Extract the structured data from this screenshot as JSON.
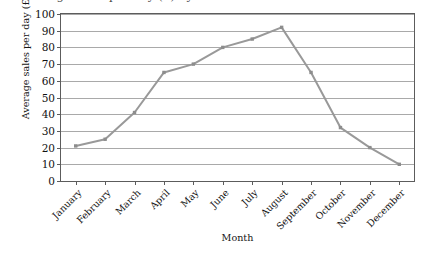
{
  "figure": {
    "title_clipped": "Average sales per day (£) by month",
    "title_is_cut_off": true
  },
  "chart_data": {
    "type": "line",
    "title": "",
    "xlabel": "Month",
    "ylabel": "Average sales per day (£)",
    "categories": [
      "January",
      "February",
      "March",
      "April",
      "May",
      "June",
      "July",
      "August",
      "September",
      "October",
      "November",
      "December"
    ],
    "values": [
      21,
      25,
      41,
      65,
      70,
      80,
      85,
      92,
      65,
      32,
      20,
      10
    ],
    "ylim": [
      0,
      100
    ],
    "ytick_labels": [
      "0",
      "10",
      "20",
      "30",
      "40",
      "50",
      "60",
      "70",
      "80",
      "90",
      "100"
    ],
    "ytick_values": [
      0,
      10,
      20,
      30,
      40,
      50,
      60,
      70,
      80,
      90,
      100
    ],
    "grid": true,
    "grid_axis": "y",
    "legend": false,
    "legend_position": "none",
    "marker": "square",
    "series_color": "#999999",
    "gridline_color": "#a9a9a9",
    "frame_color": "#5c5c5c"
  }
}
